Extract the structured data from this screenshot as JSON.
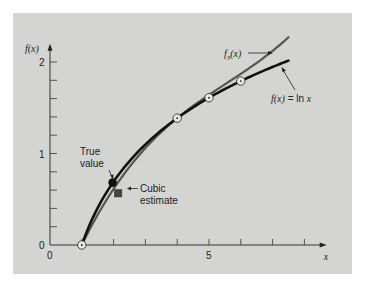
{
  "chart_data": {
    "type": "line",
    "title": "",
    "xlabel": "x",
    "ylabel": "f(x)",
    "xlim": [
      0,
      8.7
    ],
    "ylim": [
      0,
      2.2
    ],
    "x_ticks": [
      0,
      1,
      2,
      3,
      4,
      5,
      6,
      7,
      8
    ],
    "x_tick_labels": [
      {
        "value": 0,
        "label": "0"
      },
      {
        "value": 5,
        "label": "5"
      }
    ],
    "y_ticks": [
      0,
      0.2,
      0.4,
      0.6,
      0.8,
      1.0,
      1.2,
      1.4,
      1.6,
      1.8,
      2.0
    ],
    "y_tick_labels": [
      {
        "value": 0,
        "label": "0"
      },
      {
        "value": 1,
        "label": "1"
      },
      {
        "value": 2,
        "label": "2"
      }
    ],
    "grid": false,
    "series": [
      {
        "name": "f(x) = ln x",
        "kind": "function",
        "function": "ln",
        "x_range": [
          1,
          7.5
        ],
        "color": "#111111"
      },
      {
        "name": "f3(x)",
        "kind": "cubic-interpolant",
        "x_range": [
          1,
          7.5
        ],
        "newton_coefficients": {
          "b0": 0,
          "b1": 0.4620981,
          "b2": -0.05187311,
          "b3": 0.007865529
        },
        "nodes": [
          1,
          4,
          5
        ],
        "color": "#555555"
      }
    ],
    "data_points": [
      {
        "x": 1,
        "y": 0
      },
      {
        "x": 4,
        "y": 1.386294
      },
      {
        "x": 5,
        "y": 1.609438
      },
      {
        "x": 6,
        "y": 1.791759
      }
    ],
    "highlight_points": [
      {
        "name": "true-value",
        "x": 2,
        "y": 0.6931472,
        "label_lines": [
          "True",
          "value"
        ],
        "color": "#111111"
      },
      {
        "name": "cubic-estimate",
        "x": 2,
        "y": 0.5658444,
        "label_lines": [
          "Cubic",
          "estimate"
        ],
        "color": "#444444"
      }
    ],
    "annotations": [
      {
        "name": "f3-label",
        "base": "f",
        "subscript": "3",
        "suffix": "(x)"
      },
      {
        "name": "lnx-label",
        "text_italic": "f(x)",
        "text_rest": " = ln ",
        "text_var": "x"
      }
    ],
    "axis_arrow_labels": {
      "x": "x",
      "y": "f(x)"
    }
  }
}
